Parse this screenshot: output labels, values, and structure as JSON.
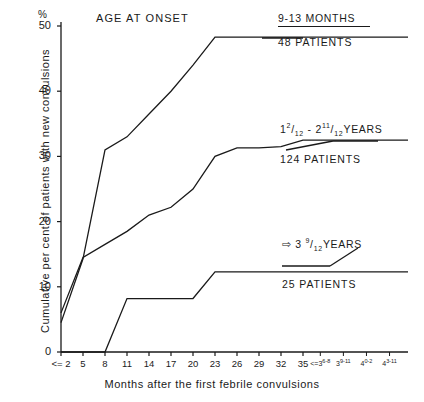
{
  "chart_data": {
    "type": "line",
    "title": "AGE AT ONSET",
    "xlabel": "Months after the first febrile convulsions",
    "ylabel": "Cumulative per cent of patients with new convulsions",
    "y_unit": "%",
    "ylim": [
      0,
      50
    ],
    "yticks": [
      0,
      10,
      20,
      30,
      40,
      50
    ],
    "ytick_labels": [
      "0",
      "10",
      "20",
      "30",
      "40",
      "50"
    ],
    "grid": false,
    "legend_position": "right",
    "categories": [
      "<= 2",
      "5",
      "8",
      "11",
      "14",
      "17",
      "20",
      "23",
      "26",
      "29",
      "32",
      "35"
    ],
    "extra_categories": [
      {
        "base": "<=3",
        "sup": "6-8"
      },
      {
        "base": "3",
        "sup": "9-11"
      },
      {
        "base": "4",
        "sup": "0-2"
      },
      {
        "base": "4",
        "sup": "3-11"
      }
    ],
    "series": [
      {
        "name": "9-13 MONTHS",
        "patients": "48 PATIENTS",
        "values": [
          4.5,
          14.3,
          31.0,
          33.0,
          36.5,
          40.0,
          44.0,
          48.3,
          48.3,
          48.3,
          48.3,
          48.3
        ]
      },
      {
        "name": "1 2/12 - 2 11/12 YEARS",
        "patients": "124 PATIENTS",
        "values": [
          6.0,
          14.5,
          16.5,
          18.5,
          21.0,
          22.2,
          25.0,
          30.0,
          31.3,
          31.3,
          31.5,
          32.5
        ]
      },
      {
        "name": "=> 3 9/12 YEARS",
        "patients": "25 PATIENTS",
        "values": [
          0,
          0,
          0,
          8.2,
          8.2,
          8.2,
          8.2,
          12.3,
          12.3,
          12.3,
          12.3,
          12.3
        ]
      }
    ]
  },
  "legend": {
    "entries": [
      {
        "title_plain": "9-13 MONTHS",
        "title_html": "9-13 MONTHS",
        "count": "48 PATIENTS"
      },
      {
        "title_plain": "1 2/12 - 2 11/12 YEARS",
        "count": "124 PATIENTS"
      },
      {
        "title_plain": "=> 3 9/12 YEARS",
        "count": "25 PATIENTS"
      }
    ]
  },
  "axes": {
    "y_unit": "%",
    "y_title": "Cumulative per cent of patients with new convulsions",
    "x_title": "Months after the first febrile convulsions"
  },
  "colors": {
    "ink": "#1a1a1a",
    "background": "#ffffff"
  }
}
